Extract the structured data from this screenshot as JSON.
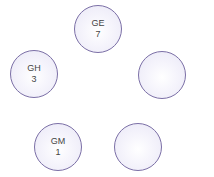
{
  "nodes": [
    {
      "id": "GE",
      "label": "GE",
      "value": "7"
    },
    {
      "id": "GH",
      "label": "GH",
      "value": "3"
    },
    {
      "id": "empty-right",
      "label": "",
      "value": ""
    },
    {
      "id": "GM",
      "label": "GM",
      "value": "1"
    },
    {
      "id": "empty-bottom-right",
      "label": "",
      "value": ""
    }
  ],
  "colors": {
    "node_border": "#7b6fa6",
    "node_fill": "#e9e7f6",
    "text": "#444444"
  }
}
